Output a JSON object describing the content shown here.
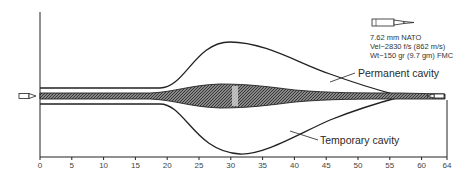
{
  "figure": {
    "cartridge": {
      "name": "7.62 mm NATO",
      "velocity": "Vel−2830 f/s (862 m/s)",
      "weight": "Wt−150 gr (9.7 gm) FMC"
    },
    "labels": {
      "permanent_cavity": "Permanent cavity",
      "temporary_cavity": "Temporary cavity"
    },
    "x_axis": {
      "ticks": [
        "0",
        "5",
        "10",
        "15",
        "20",
        "25",
        "30",
        "35",
        "40",
        "45",
        "50",
        "55",
        "60",
        "64"
      ],
      "unit_hint": "cm"
    },
    "icons": [
      "bullet-icon-entry",
      "cartridge-icon",
      "bullet-icon-exit"
    ]
  }
}
